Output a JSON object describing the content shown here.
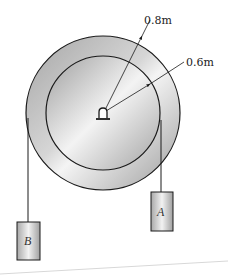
{
  "diagram": {
    "type": "pulley system",
    "outer_radius_label": "0.8m",
    "inner_radius_label": "0.6m",
    "blocks": [
      {
        "name": "A",
        "label": "A",
        "hangs_from": "inner radius, right side"
      },
      {
        "name": "B",
        "label": "B",
        "hangs_from": "outer radius, left side"
      }
    ],
    "colors": {
      "stroke": "#1a1a1a",
      "disk_light": "#f2f2f2",
      "disk_dark": "#9a9a9a",
      "block_light": "#f0f0f0",
      "block_dark": "#a8a8a8"
    }
  }
}
